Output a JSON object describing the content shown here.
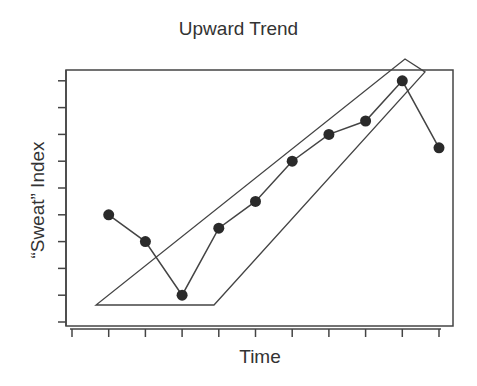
{
  "chart": {
    "title": "Upward Trend",
    "xlabel": "Time",
    "ylabel": "“Sweat” Index"
  },
  "colors": {
    "line": "#444444",
    "point": "#2a2a2a",
    "background": "#ffffff"
  },
  "chart_data": {
    "type": "line",
    "title": "Upward Trend",
    "xlabel": "Time",
    "ylabel": "“Sweat” Index",
    "x_tick_count": 11,
    "y_tick_count": 10,
    "tick_labels_shown": false,
    "grid": false,
    "legend": null,
    "units_note": "values in tick-index units (no numeric labels on axes); x = tick index 0-10, y = tick index 0-9",
    "x": [
      1,
      2,
      3,
      4,
      5,
      6,
      7,
      8,
      9,
      10
    ],
    "series": [
      {
        "name": "Sweat Index",
        "values": [
          4.0,
          3.0,
          1.0,
          3.5,
          4.5,
          6.0,
          7.0,
          7.5,
          9.0,
          6.5
        ]
      }
    ],
    "xlim": [
      0,
      10.4
    ],
    "ylim": [
      -0.15,
      9.4
    ],
    "annotations": [
      {
        "type": "polygon",
        "description": "enclosing shape highlighting upward trend from point 3 to point 9",
        "vertices_px": [
          [
            96,
            305
          ],
          [
            214,
            305
          ],
          [
            425,
            72
          ],
          [
            405,
            59
          ]
        ]
      }
    ]
  }
}
